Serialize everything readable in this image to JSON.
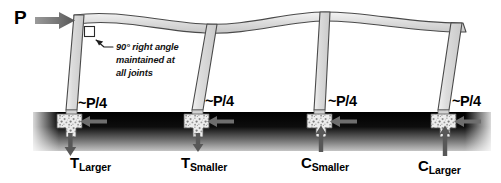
{
  "diagram": {
    "type": "structural-engineering-sketch",
    "width": 501,
    "height": 183
  },
  "load": {
    "label": "P",
    "arrow_icon": "right-arrow-icon",
    "direction": "right",
    "description": "Lateral point load applied at the top-left joint of the frame"
  },
  "annotation": {
    "text": "90° right angle maintained at all joints",
    "line1": "90° right angle",
    "line2": "maintained at",
    "line3": "all joints",
    "leader_icon": "leader-line-arrow-icon",
    "marker_icon": "right-angle-square-icon"
  },
  "frame": {
    "beam_label": "deformed-beam",
    "column_count": 4,
    "columns": [
      {
        "id": "column-1",
        "top_x": 81,
        "base_x": 69
      },
      {
        "id": "column-2",
        "top_x": 212,
        "base_x": 196
      },
      {
        "id": "column-3",
        "top_x": 325,
        "base_x": 319
      },
      {
        "id": "column-4",
        "top_x": 456,
        "base_x": 443
      }
    ]
  },
  "ground": {
    "label": "soil-band",
    "top_color": "#000000",
    "bottom_color": "#b9b9b9"
  },
  "supports": [
    {
      "id": "support-1",
      "footing_icon": "concrete-footing-icon",
      "shear_label": "~P/4",
      "shear_arrow_icon": "left-arrow-icon",
      "shear_direction": "left",
      "reaction_symbol": "T",
      "reaction_subscript": "Larger",
      "reaction_arrow_icon": "down-arrow-icon",
      "reaction_direction": "down",
      "reaction_type": "tension",
      "x": 69
    },
    {
      "id": "support-2",
      "footing_icon": "concrete-footing-icon",
      "shear_label": "~P/4",
      "shear_arrow_icon": "left-arrow-icon",
      "shear_direction": "left",
      "reaction_symbol": "T",
      "reaction_subscript": "Smaller",
      "reaction_arrow_icon": "down-arrow-icon",
      "reaction_direction": "down",
      "reaction_type": "tension",
      "x": 196
    },
    {
      "id": "support-3",
      "footing_icon": "concrete-footing-icon",
      "shear_label": "~P/4",
      "shear_arrow_icon": "left-arrow-icon",
      "shear_direction": "left",
      "reaction_symbol": "C",
      "reaction_subscript": "Smaller",
      "reaction_arrow_icon": "up-arrow-icon",
      "reaction_direction": "up",
      "reaction_type": "compression",
      "x": 319
    },
    {
      "id": "support-4",
      "footing_icon": "concrete-footing-icon",
      "shear_label": "~P/4",
      "shear_arrow_icon": "left-arrow-icon",
      "shear_direction": "left",
      "reaction_symbol": "C",
      "reaction_subscript": "Larger",
      "reaction_arrow_icon": "up-arrow-icon",
      "reaction_direction": "up",
      "reaction_type": "compression",
      "x": 443
    }
  ],
  "colors": {
    "member_fill": "#d9d9d9",
    "member_stroke": "#3a3a3a",
    "arrow_gray": "#6e6e6e",
    "footing_fill": "#e8e8e8",
    "text": "#000000"
  }
}
